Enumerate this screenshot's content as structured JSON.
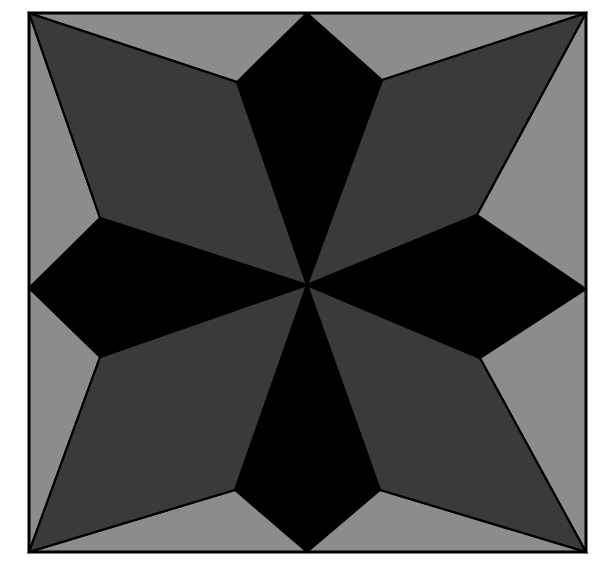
{
  "figure": {
    "canvas": {
      "width": 606,
      "height": 576,
      "background": "#ffffff"
    },
    "colors": {
      "background": "#ffffff",
      "frame_fill": "#8c8c8c",
      "light_gray": "#8c8c8c",
      "dark_gray": "#3a3a3a",
      "black": "#000000",
      "stroke": "#000000"
    },
    "stroke_width": 2,
    "frame": {
      "label": "square-frame",
      "points": "29,13 586,13 586,552 29,552"
    },
    "center": {
      "x": 307,
      "y": 285
    },
    "star_points": [
      {
        "name": "top-point-black",
        "tip": {
          "x": 307,
          "y": 13
        },
        "left": {
          "x": 237,
          "y": 82
        },
        "right": {
          "x": 382,
          "y": 80
        },
        "fill": "#000000"
      },
      {
        "name": "right-point-black",
        "tip": {
          "x": 586,
          "y": 289
        },
        "left": {
          "x": 477,
          "y": 215
        },
        "right": {
          "x": 480,
          "y": 358
        },
        "fill": "#000000"
      },
      {
        "name": "bottom-point-black",
        "tip": {
          "x": 307,
          "y": 552
        },
        "left": {
          "x": 380,
          "y": 490
        },
        "right": {
          "x": 235,
          "y": 490
        },
        "fill": "#000000"
      },
      {
        "name": "left-point-black",
        "tip": {
          "x": 29,
          "y": 288
        },
        "left": {
          "x": 100,
          "y": 357
        },
        "right": {
          "x": 100,
          "y": 218
        },
        "fill": "#000000"
      },
      {
        "name": "top-left-point-gray",
        "tip": {
          "x": 29,
          "y": 13
        },
        "left": {
          "x": 100,
          "y": 218
        },
        "right": {
          "x": 237,
          "y": 82
        },
        "fill": "#3a3a3a"
      },
      {
        "name": "top-right-point-gray",
        "tip": {
          "x": 586,
          "y": 13
        },
        "left": {
          "x": 382,
          "y": 80
        },
        "right": {
          "x": 477,
          "y": 215
        },
        "fill": "#3a3a3a"
      },
      {
        "name": "bottom-right-point-gray",
        "tip": {
          "x": 586,
          "y": 552
        },
        "left": {
          "x": 480,
          "y": 358
        },
        "right": {
          "x": 380,
          "y": 490
        },
        "fill": "#3a3a3a"
      },
      {
        "name": "bottom-left-point-gray",
        "tip": {
          "x": 29,
          "y": 552
        },
        "left": {
          "x": 235,
          "y": 490
        },
        "right": {
          "x": 100,
          "y": 357
        },
        "fill": "#3a3a3a"
      }
    ],
    "spokes": [
      {
        "name": "spoke-to-top-left",
        "to": {
          "x": 237,
          "y": 82
        }
      },
      {
        "name": "spoke-to-top-right",
        "to": {
          "x": 382,
          "y": 80
        }
      },
      {
        "name": "spoke-to-right-top",
        "to": {
          "x": 477,
          "y": 215
        }
      },
      {
        "name": "spoke-to-right-bottom",
        "to": {
          "x": 480,
          "y": 358
        }
      },
      {
        "name": "spoke-to-bottom-right",
        "to": {
          "x": 380,
          "y": 490
        }
      },
      {
        "name": "spoke-to-bottom-left",
        "to": {
          "x": 235,
          "y": 490
        }
      },
      {
        "name": "spoke-to-left-bottom",
        "to": {
          "x": 100,
          "y": 357
        }
      },
      {
        "name": "spoke-to-left-top",
        "to": {
          "x": 100,
          "y": 218
        }
      }
    ],
    "corner_rays": [
      {
        "name": "ray-top-left-a",
        "from": {
          "x": 29,
          "y": 13
        },
        "to": {
          "x": 100,
          "y": 218
        }
      },
      {
        "name": "ray-top-left-b",
        "from": {
          "x": 29,
          "y": 13
        },
        "to": {
          "x": 237,
          "y": 82
        }
      },
      {
        "name": "ray-top-right-a",
        "from": {
          "x": 586,
          "y": 13
        },
        "to": {
          "x": 382,
          "y": 80
        }
      },
      {
        "name": "ray-top-right-b",
        "from": {
          "x": 586,
          "y": 13
        },
        "to": {
          "x": 477,
          "y": 215
        }
      },
      {
        "name": "ray-bottom-right-a",
        "from": {
          "x": 586,
          "y": 552
        },
        "to": {
          "x": 480,
          "y": 358
        }
      },
      {
        "name": "ray-bottom-right-b",
        "from": {
          "x": 586,
          "y": 552
        },
        "to": {
          "x": 380,
          "y": 490
        }
      },
      {
        "name": "ray-bottom-left-a",
        "from": {
          "x": 29,
          "y": 552
        },
        "to": {
          "x": 235,
          "y": 490
        }
      },
      {
        "name": "ray-bottom-left-b",
        "from": {
          "x": 29,
          "y": 552
        },
        "to": {
          "x": 100,
          "y": 357
        }
      }
    ]
  }
}
